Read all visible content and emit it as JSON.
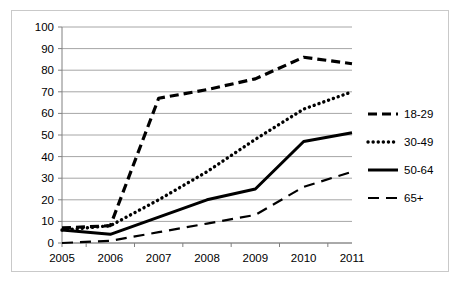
{
  "chart_data": {
    "type": "line",
    "title": "",
    "subtitle": "",
    "xlabel": "",
    "ylabel": "",
    "x": [
      "2005",
      "2006",
      "2007",
      "2008",
      "2009",
      "2010",
      "2011"
    ],
    "categories": [
      "2005",
      "2006",
      "2007",
      "2008",
      "2009",
      "2010",
      "2011"
    ],
    "xlim": [
      "2005",
      "2011"
    ],
    "ylim": [
      0,
      100
    ],
    "ytick_labels": [
      "0",
      "10",
      "20",
      "30",
      "40",
      "50",
      "60",
      "70",
      "80",
      "90",
      "100"
    ],
    "yticks": [
      0,
      10,
      20,
      30,
      40,
      50,
      60,
      70,
      80,
      90,
      100
    ],
    "grid": "horizontal",
    "legend_position": "right",
    "series": [
      {
        "name": "18-29",
        "style": "dashed",
        "color": "#000000",
        "values": [
          7,
          8,
          67,
          71,
          76,
          86,
          83
        ]
      },
      {
        "name": "30-49",
        "style": "dotted",
        "color": "#000000",
        "values": [
          6,
          8,
          20,
          33,
          48,
          62,
          70
        ]
      },
      {
        "name": "50-64",
        "style": "solid",
        "color": "#000000",
        "values": [
          6,
          4,
          12,
          20,
          25,
          47,
          51
        ]
      },
      {
        "name": "65+",
        "style": "long-dashed",
        "color": "#000000",
        "values": [
          0,
          1,
          5,
          9,
          13,
          26,
          33
        ]
      }
    ]
  },
  "legend": {
    "items": [
      {
        "label": "18-29",
        "swatch": "dashed-line-swatch"
      },
      {
        "label": "30-49",
        "swatch": "dotted-line-swatch"
      },
      {
        "label": "50-64",
        "swatch": "solid-line-swatch"
      },
      {
        "label": "65+",
        "swatch": "long-dashed-line-swatch"
      }
    ]
  },
  "axes": {
    "y_labels": [
      "100",
      "90",
      "80",
      "70",
      "60",
      "50",
      "40",
      "30",
      "20",
      "10",
      "0"
    ],
    "x_labels": [
      "2005",
      "2006",
      "2007",
      "2008",
      "2009",
      "2010",
      "2011"
    ]
  },
  "colors": {
    "line": "#000000",
    "grid": "#a6a6a6",
    "axis": "#808080",
    "frame": "#c9c9c9",
    "background": "#ffffff"
  }
}
